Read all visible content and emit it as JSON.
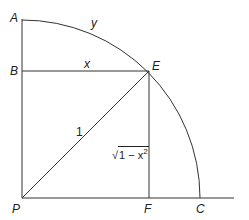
{
  "diagram": {
    "colors": {
      "stroke": "#333333",
      "text": "#222222",
      "background": "#ffffff"
    },
    "points": {
      "A": {
        "label": "A",
        "x": 22,
        "y": 19
      },
      "B": {
        "label": "B",
        "x": 22,
        "y": 71
      },
      "E": {
        "label": "E",
        "x": 149,
        "y": 71
      },
      "P": {
        "label": "P",
        "x": 22,
        "y": 198
      },
      "F": {
        "label": "F",
        "x": 149,
        "y": 198
      },
      "C": {
        "label": "C",
        "x": 200,
        "y": 198
      }
    },
    "segment_labels": {
      "arc_AE": "y",
      "BE": "x",
      "PE": "1",
      "EF_radicand": "1 − x",
      "EF_exponent": "2",
      "EF_root": "√"
    },
    "radius": 178,
    "baseline_end_x": 234
  }
}
